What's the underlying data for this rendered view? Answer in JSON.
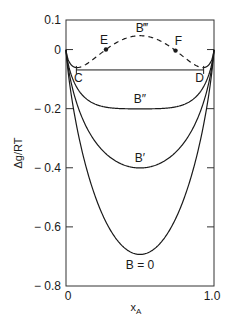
{
  "chart_data": {
    "type": "line",
    "title": "",
    "xlabel": "x_A",
    "xlabel_main": "x",
    "xlabel_sub": "A",
    "ylabel": "Δg/RT",
    "xlim": [
      0,
      1.0
    ],
    "ylim": [
      -0.8,
      0.1
    ],
    "grid": false,
    "legend": "none (curves labeled inline)",
    "x_ticks": [
      {
        "value": 0,
        "label": "0"
      },
      {
        "value": 1.0,
        "label": "1.0"
      }
    ],
    "y_ticks": [
      {
        "value": 0.1,
        "label": "0.1"
      },
      {
        "value": 0,
        "label": "0"
      },
      {
        "value": -0.2,
        "label": "− 0.2"
      },
      {
        "value": -0.4,
        "label": "− 0.4"
      },
      {
        "value": -0.6,
        "label": "− 0.6"
      },
      {
        "value": -0.8,
        "label": "− 0.8"
      }
    ],
    "formula": "Δg/RT = x ln x + (1−x) ln(1−x) + B·x(1−x)",
    "series": [
      {
        "name": "B = 0",
        "B": 0.0,
        "style": "solid",
        "min_value": -0.69,
        "label": "B = 0"
      },
      {
        "name": "B′",
        "B": 1.17,
        "style": "solid",
        "min_value": -0.4,
        "label": "B′"
      },
      {
        "name": "B″",
        "B": 1.97,
        "style": "solid",
        "min_value": -0.2,
        "label": "B″"
      },
      {
        "name": "B‴",
        "B": 2.96,
        "style": "dashed-between-C-D",
        "max_value": 0.046,
        "label": "B‴"
      }
    ],
    "annotations": {
      "tangent_line": {
        "from": "C",
        "to": "D",
        "y": -0.069,
        "x": [
          0.07,
          0.93
        ]
      },
      "points": [
        {
          "label": "C",
          "x": 0.07,
          "y": -0.069,
          "marker": "cross"
        },
        {
          "label": "D",
          "x": 0.93,
          "y": -0.069,
          "marker": "cross"
        },
        {
          "label": "E",
          "x": 0.27,
          "y": -0.005,
          "marker": "dot"
        },
        {
          "label": "F",
          "x": 0.74,
          "y": 0.005,
          "marker": "dot"
        }
      ]
    }
  }
}
